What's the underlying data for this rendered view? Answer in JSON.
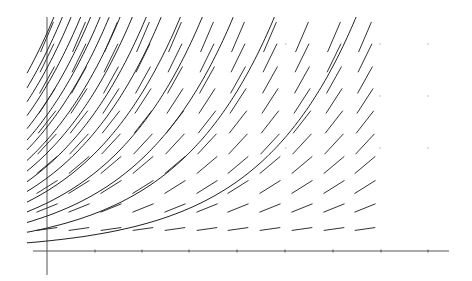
{
  "chart_data": {
    "type": "line",
    "title": "",
    "subtitle": "",
    "xlabel": "",
    "ylabel": "",
    "grid": false,
    "legend": null,
    "colors": {
      "axis": "#555555",
      "segments": "#333333",
      "curves": "#222222",
      "background": "#ffffff"
    },
    "axes": {
      "origin_px": [
        47,
        251
      ],
      "x_axis_px": [
        33,
        449
      ],
      "y_axis_px": [
        17,
        275
      ],
      "x_ticks_px": [
        95,
        142,
        189,
        237,
        285,
        333,
        381,
        428
      ],
      "x_tick_labels": [],
      "y_tick_labels": []
    },
    "slope_field": {
      "columns_px": [
        47,
        79,
        111,
        143,
        175,
        207,
        238,
        270,
        302,
        334,
        365
      ],
      "rows_px": [
        229,
        208,
        187,
        165,
        144,
        122,
        101,
        80,
        58,
        37
      ],
      "angles_deg": [
        8,
        22,
        32,
        40,
        47,
        52,
        57,
        61,
        64,
        67
      ],
      "segment_length_px": [
        20,
        22,
        24,
        26,
        27,
        28,
        29,
        30,
        31,
        32
      ]
    },
    "solution_curves": {
      "growth_rate_per_px": 0.0102,
      "start_x_px": 27,
      "heights_at_y_axis_px": [
        10,
        23,
        35,
        48,
        60,
        73,
        85,
        98,
        111,
        124,
        136,
        150,
        166,
        183,
        200,
        218
      ]
    },
    "faint_dots_px": [
      [
        286,
        44
      ],
      [
        380,
        44
      ],
      [
        428,
        44
      ],
      [
        380,
        96
      ],
      [
        428,
        96
      ],
      [
        380,
        148
      ],
      [
        428,
        148
      ],
      [
        286,
        148
      ]
    ]
  }
}
